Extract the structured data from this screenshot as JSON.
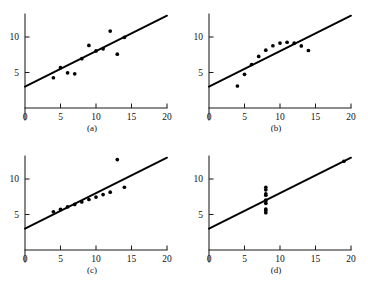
{
  "figure": {
    "panel_order": [
      "a",
      "b",
      "c",
      "d"
    ],
    "background_color": "#ffffff",
    "ink_color": "#000000",
    "faint_note": ""
  },
  "captions": {
    "a": "(a)",
    "b": "(b)",
    "c": "(c)",
    "d": "(d)"
  },
  "axes": {
    "x_ticks": [
      0,
      5,
      10,
      15,
      20
    ],
    "x_tick_labels": [
      "0",
      "5",
      "10",
      "15",
      "20"
    ],
    "y_ticks": [
      5,
      10
    ],
    "y_tick_labels": [
      "5",
      "10"
    ],
    "xlim": [
      0,
      20
    ],
    "ylim": [
      0,
      13.5
    ],
    "grid": false,
    "xlabel": "",
    "ylabel": ""
  },
  "chart_data": [
    {
      "type": "scatter",
      "id": "a",
      "title": "(a)",
      "xlabel": "",
      "ylabel": "",
      "xlim": [
        0,
        20
      ],
      "ylim": [
        0,
        13.5
      ],
      "grid": false,
      "legend": "none",
      "x": [
        10.0,
        8.0,
        13.0,
        9.0,
        11.0,
        14.0,
        6.0,
        4.0,
        12.0,
        7.0,
        5.0
      ],
      "y": [
        8.04,
        6.95,
        7.58,
        8.81,
        8.33,
        9.96,
        4.95,
        4.26,
        10.84,
        4.82,
        5.68
      ],
      "fit_line": {
        "type": "line",
        "intercept": 3.0,
        "slope": 0.5,
        "x": [
          0,
          20
        ],
        "y": [
          3.0,
          13.0
        ]
      }
    },
    {
      "type": "scatter",
      "id": "b",
      "title": "(b)",
      "xlabel": "",
      "ylabel": "",
      "xlim": [
        0,
        20
      ],
      "ylim": [
        0,
        13.5
      ],
      "grid": false,
      "legend": "none",
      "x": [
        10.0,
        8.0,
        13.0,
        9.0,
        11.0,
        14.0,
        6.0,
        4.0,
        12.0,
        7.0,
        5.0
      ],
      "y": [
        9.14,
        8.14,
        8.74,
        8.77,
        9.26,
        8.1,
        6.13,
        3.1,
        9.13,
        7.26,
        4.74
      ],
      "fit_line": {
        "type": "line",
        "intercept": 3.0,
        "slope": 0.5,
        "x": [
          0,
          20
        ],
        "y": [
          3.0,
          13.0
        ]
      }
    },
    {
      "type": "scatter",
      "id": "c",
      "title": "(c)",
      "xlabel": "",
      "ylabel": "",
      "xlim": [
        0,
        20
      ],
      "ylim": [
        0,
        13.5
      ],
      "grid": false,
      "legend": "none",
      "x": [
        10.0,
        8.0,
        13.0,
        9.0,
        11.0,
        14.0,
        6.0,
        4.0,
        12.0,
        7.0,
        5.0
      ],
      "y": [
        7.46,
        6.77,
        12.74,
        7.11,
        7.81,
        8.84,
        6.08,
        5.39,
        8.15,
        6.42,
        5.73
      ],
      "fit_line": {
        "type": "line",
        "intercept": 3.0,
        "slope": 0.5,
        "x": [
          0,
          20
        ],
        "y": [
          3.0,
          13.0
        ]
      }
    },
    {
      "type": "scatter",
      "id": "d",
      "title": "(d)",
      "xlabel": "",
      "ylabel": "",
      "xlim": [
        0,
        20
      ],
      "ylim": [
        0,
        13.5
      ],
      "grid": false,
      "legend": "none",
      "x": [
        8.0,
        8.0,
        8.0,
        8.0,
        8.0,
        8.0,
        8.0,
        19.0,
        8.0,
        8.0,
        8.0
      ],
      "y": [
        6.58,
        5.76,
        7.71,
        8.84,
        8.47,
        7.04,
        5.25,
        12.5,
        5.56,
        7.91,
        6.89
      ],
      "fit_line": {
        "type": "line",
        "intercept": 3.0,
        "slope": 0.5,
        "x": [
          0,
          20
        ],
        "y": [
          3.0,
          13.0
        ]
      }
    }
  ]
}
